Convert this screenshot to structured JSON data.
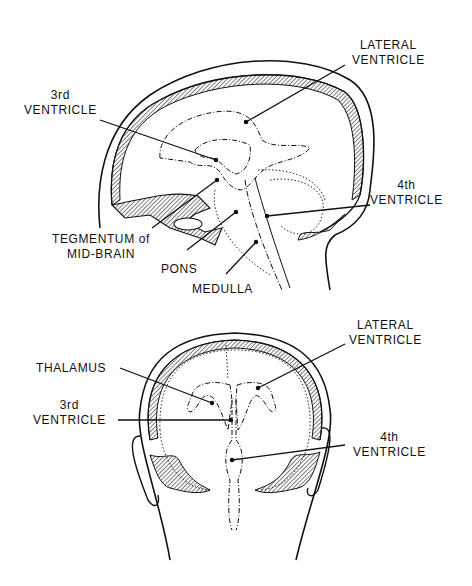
{
  "sagittal_view": {
    "labels": {
      "lateral_ventricle": [
        "LATERAL",
        "VENTRICLE"
      ],
      "third_ventricle": [
        "3rd",
        "VENTRICLE"
      ],
      "fourth_ventricle": [
        "4th",
        "VENTRICLE"
      ],
      "tegmentum": [
        "TEGMENTUM of",
        "MID-BRAIN"
      ],
      "pons": "PONS",
      "medulla": "MEDULLA"
    }
  },
  "posterior_view": {
    "labels": {
      "lateral_ventricle": [
        "LATERAL",
        "VENTRICLE"
      ],
      "thalamus": "THALAMUS",
      "third_ventricle": [
        "3rd",
        "VENTRICLE"
      ],
      "fourth_ventricle": [
        "4th",
        "VENTRICLE"
      ]
    }
  },
  "colors": {
    "ink": "#111111",
    "background": "#ffffff"
  }
}
